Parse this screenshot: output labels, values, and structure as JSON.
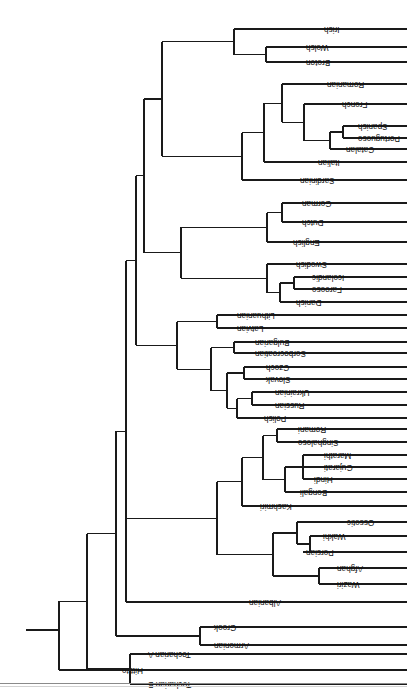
{
  "figure": {
    "type": "dendrogram",
    "orientation": "rotated-180",
    "line_color": "#1a1a1a",
    "background_color": "#ffffff",
    "label_color": "#111111"
  },
  "chart_data": {
    "type": "table",
    "xlabel": "",
    "ylabel": "",
    "grid": false,
    "legend": "none",
    "tip_labels": [
      "Hittite",
      "Tocharian B",
      "Tocharian A",
      "Armenian",
      "Greek",
      "Albanian",
      "Waziri",
      "Afghan",
      "Persian",
      "Wakhi",
      "Ossetic",
      "Kashmiri",
      "Bengali",
      "Hindi",
      "Gujarati",
      "Marathi",
      "Singhalese",
      "Romani",
      "Polish",
      "Russian",
      "Ukrainian",
      "Slovak",
      "Czech",
      "Serbocroatian",
      "Bulgarian",
      "Latvian",
      "Lithuanian",
      "Danish",
      "Faroese",
      "Icelandic",
      "Swedish",
      "English",
      "Dutch",
      "German",
      "Sardinian",
      "Italian",
      "Catalan",
      "Portuguese",
      "Spanish",
      "French",
      "Romanian",
      "Breton",
      "Welsh",
      "Irish"
    ],
    "tips": [
      {
        "label": "Hittite",
        "y": 22,
        "x": 288
      },
      {
        "label": "Tocharian B",
        "y": 8,
        "x": 262
      },
      {
        "label": "Tocharian A",
        "y": 38,
        "x": 262
      },
      {
        "label": "Armenian",
        "y": 47,
        "x": 196
      },
      {
        "label": "Greek",
        "y": 65,
        "x": 196
      },
      {
        "label": "Albanian",
        "y": 90,
        "x": 161
      },
      {
        "label": "Waziri",
        "y": 108,
        "x": 73
      },
      {
        "label": "Afghan",
        "y": 124,
        "x": 73
      },
      {
        "label": "Persian",
        "y": 140,
        "x": 104
      },
      {
        "label": "Wakhi",
        "y": 156,
        "x": 87
      },
      {
        "label": "Ossetic",
        "y": 170,
        "x": 63
      },
      {
        "label": "Kashmiri",
        "y": 186,
        "x": 150
      },
      {
        "label": "Bengali",
        "y": 200,
        "x": 110
      },
      {
        "label": "Hindi",
        "y": 213,
        "x": 96
      },
      {
        "label": "Gujarati",
        "y": 225,
        "x": 86
      },
      {
        "label": "Marathi",
        "y": 237,
        "x": 86
      },
      {
        "label": "Singhalese",
        "y": 250,
        "x": 112
      },
      {
        "label": "Romani",
        "y": 263,
        "x": 112
      },
      {
        "label": "Polish",
        "y": 274,
        "x": 146
      },
      {
        "label": "Russian",
        "y": 287,
        "x": 135
      },
      {
        "label": "Ukrainian",
        "y": 300,
        "x": 135
      },
      {
        "label": "Slovak",
        "y": 313,
        "x": 144
      },
      {
        "label": "Czech",
        "y": 325,
        "x": 144
      },
      {
        "label": "Serbocroatian",
        "y": 339,
        "x": 155
      },
      {
        "label": "Bulgarian",
        "y": 350,
        "x": 155
      },
      {
        "label": "Latvian",
        "y": 364,
        "x": 173
      },
      {
        "label": "Lithuanian",
        "y": 377,
        "x": 173
      },
      {
        "label": "Danish",
        "y": 390,
        "x": 114
      },
      {
        "label": "Faroese",
        "y": 403,
        "x": 98
      },
      {
        "label": "Icelandic",
        "y": 415,
        "x": 98
      },
      {
        "label": "Swedish",
        "y": 428,
        "x": 114
      },
      {
        "label": "English",
        "y": 450,
        "x": 117
      },
      {
        "label": "Dutch",
        "y": 470,
        "x": 108
      },
      {
        "label": "German",
        "y": 489,
        "x": 108
      },
      {
        "label": "Sardinian",
        "y": 512,
        "x": 110
      },
      {
        "label": "Italian",
        "y": 530,
        "x": 92
      },
      {
        "label": "Catalan",
        "y": 543,
        "x": 64
      },
      {
        "label": "Portuguese",
        "y": 554,
        "x": 52
      },
      {
        "label": "Spanish",
        "y": 566,
        "x": 52
      },
      {
        "label": "French",
        "y": 588,
        "x": 68
      },
      {
        "label": "Romanian",
        "y": 608,
        "x": 83
      },
      {
        "label": "Breton",
        "y": 630,
        "x": 104
      },
      {
        "label": "Welsh",
        "y": 645,
        "x": 104
      },
      {
        "label": "Irish",
        "y": 663,
        "x": 86
      }
    ],
    "internal_nodes": [
      {
        "name": "tocharian",
        "x": 277,
        "children_y": [
          8,
          38
        ]
      },
      {
        "name": "greek-armenian",
        "x": 207,
        "children_y": [
          47,
          65
        ]
      },
      {
        "name": "waziri-afghan",
        "x": 88,
        "children_y": [
          108,
          124
        ]
      },
      {
        "name": "wakhi-persian",
        "x": 97,
        "children_y": [
          140,
          156
        ]
      },
      {
        "name": "iranian-ossetic",
        "x": 110,
        "children_y": [
          148,
          170
        ]
      },
      {
        "name": "iranian",
        "x": 134,
        "children_y": [
          116,
          159
        ]
      },
      {
        "name": "hindi-gujarati",
        "x": 104,
        "children_y": [
          213,
          231
        ]
      },
      {
        "name": "bengali-group",
        "x": 122,
        "children_y": [
          200,
          222
        ]
      },
      {
        "name": "singh-romani",
        "x": 130,
        "children_y": [
          250,
          263
        ]
      },
      {
        "name": "indic-core",
        "x": 144,
        "children_y": [
          211,
          256
        ]
      },
      {
        "name": "indic",
        "x": 165,
        "children_y": [
          186,
          233
        ]
      },
      {
        "name": "indo-iranian",
        "x": 190,
        "children_y": [
          137,
          209
        ]
      },
      {
        "name": "russ-ukr",
        "x": 155,
        "children_y": [
          287,
          300
        ]
      },
      {
        "name": "east-slavic",
        "x": 170,
        "children_y": [
          274,
          293
        ]
      },
      {
        "name": "czech-slovak",
        "x": 163,
        "children_y": [
          313,
          325
        ]
      },
      {
        "name": "west-slavic",
        "x": 180,
        "children_y": [
          283,
          319
        ]
      },
      {
        "name": "south-slavic",
        "x": 173,
        "children_y": [
          339,
          350
        ]
      },
      {
        "name": "slavic",
        "x": 196,
        "children_y": [
          301,
          344
        ]
      },
      {
        "name": "baltic",
        "x": 190,
        "children_y": [
          364,
          377
        ]
      },
      {
        "name": "balto-slavic",
        "x": 230,
        "children_y": [
          322,
          370
        ]
      },
      {
        "name": "faro-ice",
        "x": 113,
        "children_y": [
          403,
          415
        ]
      },
      {
        "name": "nordic-inner",
        "x": 127,
        "children_y": [
          390,
          409
        ]
      },
      {
        "name": "north-germanic",
        "x": 140,
        "children_y": [
          399,
          428
        ]
      },
      {
        "name": "dutch-german",
        "x": 125,
        "children_y": [
          470,
          489
        ]
      },
      {
        "name": "west-germanic",
        "x": 140,
        "children_y": [
          450,
          479
        ]
      },
      {
        "name": "germanic",
        "x": 226,
        "children_y": [
          413,
          464
        ]
      },
      {
        "name": "port-span",
        "x": 64,
        "children_y": [
          554,
          566
        ]
      },
      {
        "name": "ibero-catalan",
        "x": 77,
        "children_y": [
          543,
          560
        ]
      },
      {
        "name": "gallo-ibero",
        "x": 103,
        "children_y": [
          551,
          588
        ]
      },
      {
        "name": "western-romance",
        "x": 125,
        "children_y": [
          569,
          608
        ]
      },
      {
        "name": "italo-romance",
        "x": 143,
        "children_y": [
          530,
          588
        ]
      },
      {
        "name": "romance",
        "x": 165,
        "children_y": [
          512,
          559
        ]
      },
      {
        "name": "brythonic",
        "x": 141,
        "children_y": [
          630,
          645
        ]
      },
      {
        "name": "celtic",
        "x": 173,
        "children_y": [
          637,
          663
        ]
      },
      {
        "name": "italo-celtic",
        "x": 245,
        "children_y": [
          535,
          650
        ]
      },
      {
        "name": "core-ie",
        "x": 263,
        "children_y": [
          438,
          592
        ]
      },
      {
        "name": "ie-minus-alb",
        "x": 271,
        "children_y": [
          276,
          515
        ]
      },
      {
        "name": "with-albanian",
        "x": 281,
        "children_y": [
          90,
          395
        ]
      },
      {
        "name": "with-greek-arm",
        "x": 291,
        "children_y": [
          56,
          242
        ]
      },
      {
        "name": "with-tocharian",
        "x": 320,
        "children_y": [
          23,
          149
        ]
      },
      {
        "name": "root",
        "x": 348,
        "children_y": [
          22,
          86
        ]
      }
    ],
    "root_stub": {
      "x_from": 348,
      "x_to": 381,
      "y": 62
    }
  }
}
